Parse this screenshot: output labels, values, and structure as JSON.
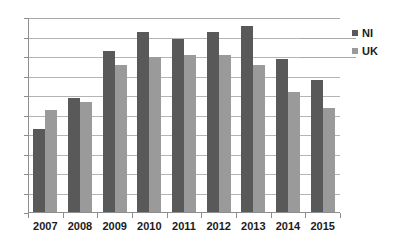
{
  "chart_data": {
    "type": "bar",
    "title": "",
    "subtitle": "",
    "xlabel": "",
    "ylabel": "",
    "categories": [
      "2007",
      "2008",
      "2009",
      "2010",
      "2011",
      "2012",
      "2013",
      "2014",
      "2015"
    ],
    "series": [
      {
        "name": "NI",
        "color": "#595959",
        "values": [
          4.3,
          5.9,
          8.3,
          9.3,
          8.9,
          9.3,
          9.6,
          7.9,
          6.8
        ]
      },
      {
        "name": "UK",
        "color": "#9a9a9a",
        "values": [
          5.3,
          5.7,
          7.6,
          8.0,
          8.1,
          8.1,
          7.6,
          6.2,
          5.4
        ]
      }
    ],
    "ylim": [
      0,
      10
    ],
    "yticks": [
      0,
      1,
      2,
      3,
      4,
      5,
      6,
      7,
      8,
      9,
      10
    ],
    "ytick_labels": [
      "0",
      "1",
      "2",
      "3",
      "4",
      "5",
      "6",
      "7",
      "8",
      "9",
      "10"
    ],
    "grid": true,
    "grid_axis": "y",
    "legend": [
      "NI",
      "UK"
    ],
    "legend_position": "right"
  },
  "legend": {
    "items": [
      {
        "label": "NI",
        "marker": "square-marker-dark"
      },
      {
        "label": "UK",
        "marker": "square-marker-light"
      }
    ]
  }
}
